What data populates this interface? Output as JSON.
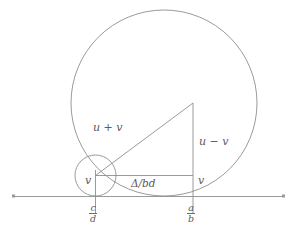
{
  "figure": {
    "background_color": "#ffffff",
    "stroke_color": "#8a8a8a",
    "text_color": "#5a5a5a",
    "axis": {
      "name": "real-number-line",
      "y": 196,
      "x_start": 12,
      "x_end": 285
    },
    "circles": [
      {
        "name": "large-circle",
        "cx": 164,
        "cy": 103,
        "r": 93,
        "tangent_point_x": 164
      },
      {
        "name": "small-circle",
        "cx": 95.5,
        "cy": 175.5,
        "r": 20.5,
        "tangent_point_x": 95.5
      }
    ],
    "triangle": {
      "name": "right-triangle",
      "vertex_left": [
        95.5,
        175.5
      ],
      "vertex_corner": [
        193,
        175.5
      ],
      "vertex_top": [
        193,
        103
      ]
    },
    "labels": {
      "hypotenuse": "u + v",
      "vertical_leg": "u − v",
      "horizontal_leg": "Δ/bd",
      "radius_small": "v",
      "radius_right": "v"
    },
    "fractions": {
      "left": {
        "numerator": "c",
        "denominator": "d"
      },
      "right": {
        "numerator": "a",
        "denominator": "b"
      }
    }
  }
}
